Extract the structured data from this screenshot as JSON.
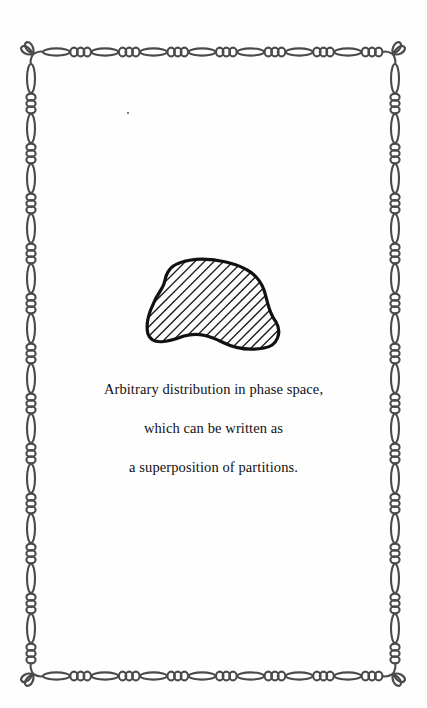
{
  "page": {
    "type": "illustration-plate",
    "background_color": "#ffffff",
    "ink_color": "#1a1a1a",
    "border_color": "#4a4a4a"
  },
  "border": {
    "style": "ornamental chain of elongated oval links alternating with clusters of three ring beads",
    "corner_ornament": "leaf-knot"
  },
  "figure": {
    "shape": "irregular closed blob",
    "fill": "diagonal hatching",
    "outline": "thick solid"
  },
  "caption": {
    "lines": [
      "Arbitrary distribution in phase space,",
      "which can be written as",
      "a superposition of partitions."
    ]
  }
}
